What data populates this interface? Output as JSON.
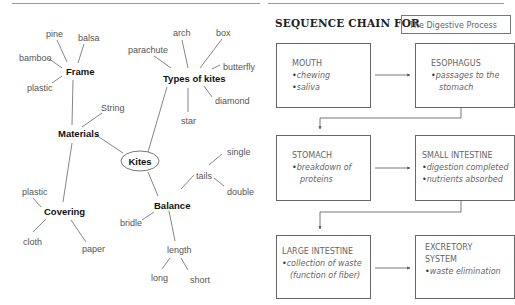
{
  "left_panel": {
    "mind_map": {
      "center": "Kites",
      "branches": [
        {
          "label": "Materials",
          "children": [
            {
              "label": "Frame",
              "children": [
                "pine",
                "balsa",
                "bamboo",
                "plastic"
              ]
            },
            {
              "label": "String",
              "children": []
            },
            {
              "label": "Covering",
              "children": [
                "plastic",
                "cloth",
                "paper"
              ]
            }
          ]
        },
        {
          "label": "Types of kites",
          "children": [
            "arch",
            "box",
            "parachute",
            "butterfly",
            "diamond",
            "star"
          ]
        },
        {
          "label": "Balance",
          "children": [
            {
              "label": "tails",
              "children": [
                "single",
                "double"
              ]
            },
            {
              "label": "bridle",
              "children": []
            },
            {
              "label": "length",
              "children": [
                "long",
                "short"
              ]
            }
          ]
        }
      ]
    },
    "labels": {
      "kites": "Kites",
      "frame": "Frame",
      "materials": "Materials",
      "covering": "Covering",
      "types": "Types of kites",
      "balance": "Balance",
      "string": "String",
      "pine": "pine",
      "balsa": "balsa",
      "bamboo": "bamboo",
      "plastic1": "plastic",
      "plastic2": "plastic",
      "cloth": "cloth",
      "paper": "paper",
      "arch": "arch",
      "box": "box",
      "parachute": "parachute",
      "butterfly": "butterfly",
      "diamond": "diamond",
      "star": "star",
      "tails": "tails",
      "single": "single",
      "double": "double",
      "bridle": "bridle",
      "length": "length",
      "long": "long",
      "short": "short"
    }
  },
  "right_panel": {
    "title": "SEQUENCE CHAIN FOR",
    "topic": "The Digestive Process",
    "steps": [
      {
        "heading": "MOUTH",
        "heading2": "",
        "bullets": [
          "chewing",
          "saliva"
        ]
      },
      {
        "heading": "ESOPHAGUS",
        "heading2": "",
        "bullets": [
          "passages to the stomach"
        ]
      },
      {
        "heading": "STOMACH",
        "heading2": "",
        "bullets": [
          "breakdown of proteins"
        ]
      },
      {
        "heading": "SMALL INTESTINE",
        "heading2": "",
        "bullets": [
          "digestion completed",
          "nutrients absorbed"
        ]
      },
      {
        "heading": "LARGE INTESTINE",
        "heading2": "",
        "bullets": [
          "collection of waste (function of fiber)"
        ]
      },
      {
        "heading": "EXCRETORY",
        "heading2": "SYSTEM",
        "bullets": [
          "waste elimination"
        ]
      }
    ]
  }
}
